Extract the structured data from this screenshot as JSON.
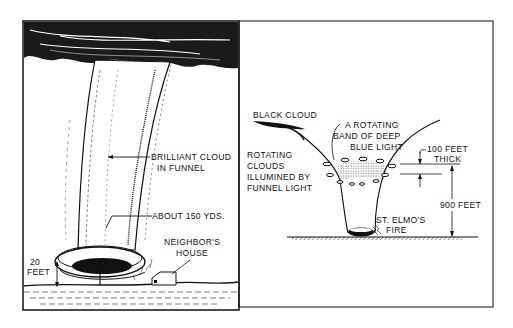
{
  "figure": {
    "left_panel": {
      "labels": {
        "brilliant_cloud_1": "BRILLIANT CLOUD",
        "brilliant_cloud_2": "IN FUNNEL",
        "about_150": "ABOUT 150 YDS.",
        "neighbor_1": "NEIGHBOR'S",
        "neighbor_2": "HOUSE",
        "height_1": "20",
        "height_2": "FEET"
      }
    },
    "right_panel": {
      "labels": {
        "black_cloud": "BLACK CLOUD",
        "band_1": "A ROTATING",
        "band_2": "BAND OF DEEP",
        "band_3": "BLUE LIGHT",
        "rotating_1": "ROTATING",
        "rotating_2": "CLOUDS",
        "rotating_3": "ILLUMINED BY",
        "rotating_4": "FUNNEL LIGHT",
        "thick_1": "100 FEET",
        "thick_2": "THICK",
        "height": "900 FEET",
        "elmo_1": "ST. ELMO'S",
        "elmo_2": "FIRE"
      }
    },
    "colors": {
      "ink": "#111111",
      "paper": "#ffffff"
    }
  }
}
